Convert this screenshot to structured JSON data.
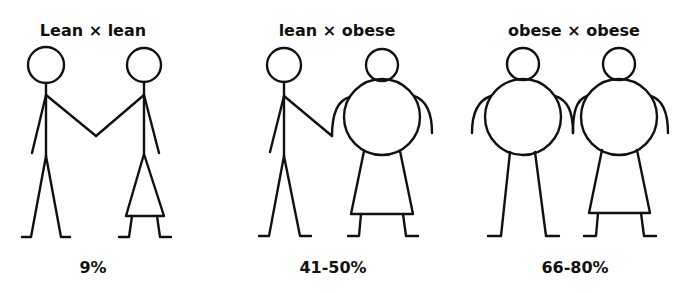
{
  "panels": [
    {
      "title": "Lean × lean",
      "percentage": "9%",
      "figures": [
        "lean man",
        "lean woman"
      ]
    },
    {
      "title": "lean × obese",
      "percentage": "41-50%",
      "figures": [
        "lean man",
        "obese woman"
      ]
    },
    {
      "title": "obese × obese",
      "percentage": "66-80%",
      "figures": [
        "obese man",
        "obese woman"
      ]
    }
  ],
  "colors": {
    "ink": "#111111",
    "background": "#ffffff"
  }
}
